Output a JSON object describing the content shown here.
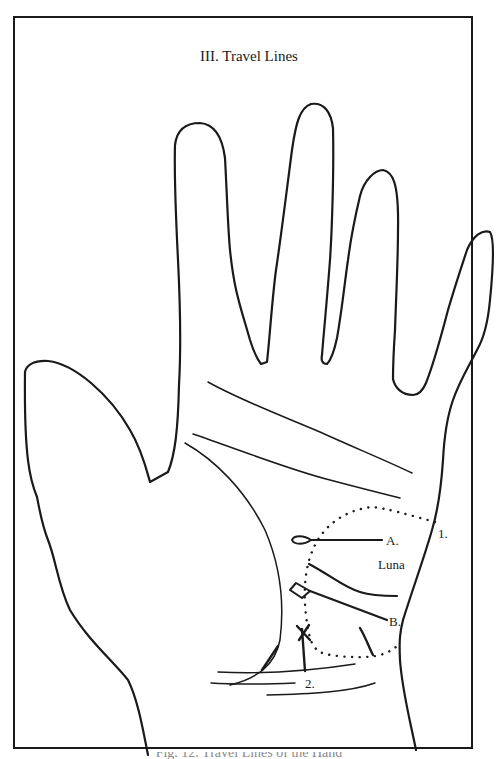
{
  "figure": {
    "title": "III.  Travel Lines",
    "caption": "Fig. 12. Travel Lines of the Hand",
    "labels": {
      "a": "A.",
      "b": "B.",
      "one": "1.",
      "two": "2.",
      "luna": "Luna"
    },
    "colors": {
      "ink": "#1a1a1a",
      "paper": "#ffffff"
    }
  }
}
